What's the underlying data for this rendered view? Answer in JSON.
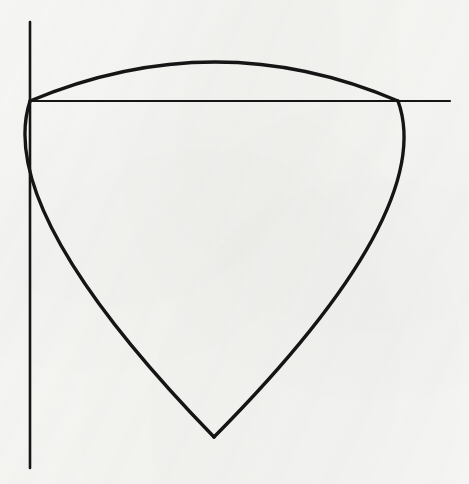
{
  "figure": {
    "kind": "geometric-line-drawing",
    "background_color": "#f7f7f5",
    "ink_color": "#151515",
    "canvas": {
      "width": 469,
      "height": 484
    }
  },
  "chart_data": {
    "type": "scatter",
    "title": "",
    "xlabel": "",
    "ylabel": "",
    "xlim": [
      0,
      469
    ],
    "ylim": [
      484,
      0
    ],
    "grid": false,
    "legend_position": "none",
    "vertices": [
      {
        "name": "left-vertex",
        "x": 30,
        "y": 101
      },
      {
        "name": "right-vertex",
        "x": 398,
        "y": 101
      },
      {
        "name": "bottom-vertex",
        "x": 214,
        "y": 437
      }
    ],
    "annotations": [
      {
        "name": "top-arc-apex",
        "x": 215,
        "y": 62
      },
      {
        "name": "left-arc-midpoint",
        "x": 58,
        "y": 240
      },
      {
        "name": "left-arc-lower",
        "x": 110,
        "y": 340
      },
      {
        "name": "right-arc-midpoint",
        "x": 372,
        "y": 240
      },
      {
        "name": "right-arc-lower",
        "x": 318,
        "y": 340
      }
    ],
    "series": [
      {
        "name": "vertical-axis-line",
        "shape": "line",
        "x": [
          30,
          30
        ],
        "y": [
          22,
          468
        ],
        "stroke_width": 2.6
      },
      {
        "name": "horizontal-chord-line",
        "shape": "line",
        "x": [
          30,
          450
        ],
        "y": [
          101,
          101
        ],
        "stroke_width": 2.2
      },
      {
        "name": "top-arc",
        "shape": "arc",
        "from": [
          30,
          101
        ],
        "to": [
          398,
          101
        ],
        "apex": [
          215,
          62
        ],
        "bulge": "upward",
        "stroke_width": 3.4
      },
      {
        "name": "left-arc",
        "shape": "arc",
        "from": [
          30,
          101
        ],
        "to": [
          214,
          437
        ],
        "via": [
          58,
          240
        ],
        "bulge": "leftward",
        "stroke_width": 3.4
      },
      {
        "name": "right-arc",
        "shape": "arc",
        "from": [
          398,
          101
        ],
        "to": [
          214,
          437
        ],
        "via": [
          372,
          240
        ],
        "bulge": "rightward",
        "stroke_width": 3.4
      }
    ]
  }
}
